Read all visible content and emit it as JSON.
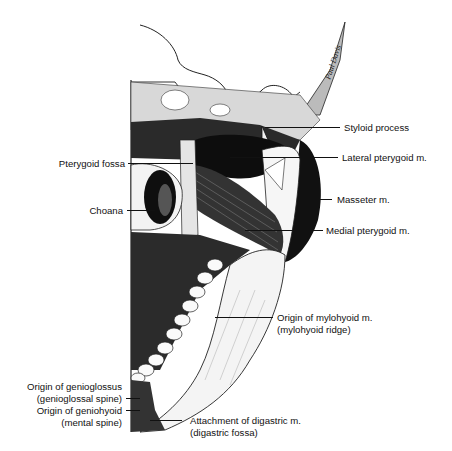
{
  "figure": {
    "signature": "Paul Davis",
    "labels": {
      "styloid_process": "Styloid process",
      "lateral_pterygoid": "Lateral pterygoid m.",
      "pterygoid_fossa": "Pterygoid fossa",
      "masseter": "Masseter m.",
      "choana": "Choana",
      "medial_pterygoid": "Medial pterygoid m.",
      "mylohyoid_line1": "Origin of mylohyoid m.",
      "mylohyoid_line2": "(mylohyoid ridge)",
      "genioglossus_line1": "Origin of genioglossus",
      "genioglossus_line2": "(genioglossal spine)",
      "geniohyoid_line1": "Origin of geniohyoid",
      "geniohyoid_line2": "(mental spine)",
      "digastric_line1": "Attachment of digastric m.",
      "digastric_line2": "(digastric fossa)"
    }
  }
}
